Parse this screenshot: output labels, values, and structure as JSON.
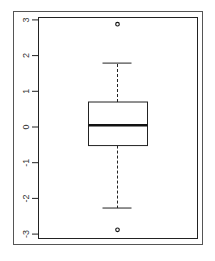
{
  "chart_data": {
    "type": "boxplot",
    "title": "",
    "xlabel": "",
    "ylabel": "",
    "ylim": [
      -3.15,
      3.15
    ],
    "yticks": [
      -3,
      -2,
      -1,
      0,
      1,
      2,
      3
    ],
    "ytick_labels": [
      "-3",
      "-2",
      "-1",
      "0",
      "1",
      "2",
      "3"
    ],
    "grid": false,
    "legend": null,
    "series": [
      {
        "name": "",
        "whisker_low": -2.27,
        "q1": -0.52,
        "median": 0.05,
        "q3": 0.7,
        "whisker_high": 1.79,
        "outliers": [
          2.88,
          -2.88
        ]
      }
    ]
  },
  "colors": {
    "frame": "#555555",
    "axis": "#111111",
    "box": "#111111"
  }
}
